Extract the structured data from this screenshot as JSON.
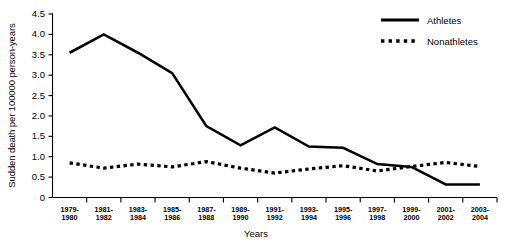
{
  "chart_data": {
    "type": "line",
    "title": "",
    "xlabel": "Years",
    "ylabel": "Sudden death per 100000 person-years",
    "categories": [
      "1979-\n1980",
      "1981-\n1982",
      "1983-\n1984",
      "1985-\n1986",
      "1987-\n1988",
      "1989-\n1990",
      "1991-\n1992",
      "1993-\n1994",
      "1995-\n1996",
      "1997-\n1998",
      "1999-\n2000",
      "2001-\n2002",
      "2003-\n2004"
    ],
    "category_lines": [
      [
        "1979-",
        "1980"
      ],
      [
        "1981-",
        "1982"
      ],
      [
        "1983-",
        "1984"
      ],
      [
        "1985-",
        "1986"
      ],
      [
        "1987-",
        "1988"
      ],
      [
        "1989-",
        "1990"
      ],
      [
        "1991-",
        "1992"
      ],
      [
        "1993-",
        "1994"
      ],
      [
        "1995-",
        "1996"
      ],
      [
        "1997-",
        "1998"
      ],
      [
        "1999-",
        "2000"
      ],
      [
        "2001-",
        "2002"
      ],
      [
        "2003-",
        "2004"
      ]
    ],
    "series": [
      {
        "name": "Athletes",
        "style": "solid",
        "color": "#000000",
        "values": [
          3.55,
          4.0,
          3.55,
          3.05,
          1.75,
          1.28,
          1.72,
          1.25,
          1.22,
          0.82,
          0.75,
          0.32,
          0.32
        ]
      },
      {
        "name": "Nonathletes",
        "style": "dotted",
        "color": "#000000",
        "values": [
          0.85,
          0.72,
          0.82,
          0.75,
          0.88,
          0.72,
          0.6,
          0.7,
          0.78,
          0.65,
          0.76,
          0.86,
          0.76
        ]
      }
    ],
    "ylim": [
      0,
      4.5
    ],
    "ytick_values": [
      0,
      0.5,
      1.0,
      1.5,
      2.0,
      2.5,
      3.0,
      3.5,
      4.0,
      4.5
    ],
    "ytick_labels": [
      "0",
      "0.5",
      "1.0",
      "1.5",
      "2.0",
      "2.5",
      "3.0",
      "3.5",
      "4.0",
      "4.5"
    ],
    "grid": false,
    "legend_position": "top-right"
  },
  "legend": {
    "entries": [
      {
        "label": "Athletes",
        "style": "solid"
      },
      {
        "label": "Nonathletes",
        "style": "dotted"
      }
    ]
  },
  "axes": {
    "x_title": "Years",
    "y_title": "Sudden death per 100000 person-years"
  }
}
